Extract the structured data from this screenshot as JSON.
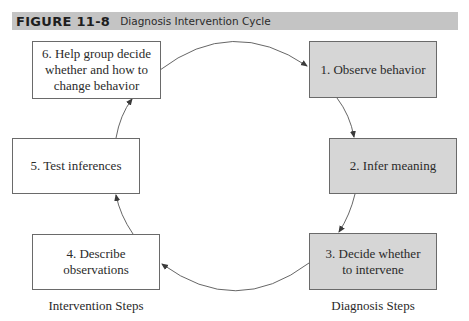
{
  "figure": {
    "number": "FIGURE 11-8",
    "title": "Diagnosis Intervention Cycle",
    "header_color": "#c4c4c4"
  },
  "steps": [
    {
      "id": 1,
      "label": "1. Observe behavior",
      "group": "diagnosis"
    },
    {
      "id": 2,
      "label": "2. Infer meaning",
      "group": "diagnosis"
    },
    {
      "id": 3,
      "label": "3. Decide whether\nto intervene",
      "group": "diagnosis"
    },
    {
      "id": 4,
      "label": "4. Describe\nobservations",
      "group": "intervention"
    },
    {
      "id": 5,
      "label": "5. Test inferences",
      "group": "intervention"
    },
    {
      "id": 6,
      "label": "6. Help group decide\nwhether and how to\nchange behavior",
      "group": "intervention"
    }
  ],
  "captions": {
    "intervention": "Intervention Steps",
    "diagnosis": "Diagnosis Steps"
  },
  "colors": {
    "diagnosis_fill": "#d6d6d6",
    "intervention_fill": "#ffffff",
    "border": "#6a6a6a",
    "arrow": "#555555"
  },
  "flow": [
    {
      "from": 1,
      "to": 2
    },
    {
      "from": 2,
      "to": 3
    },
    {
      "from": 3,
      "to": 4
    },
    {
      "from": 4,
      "to": 5
    },
    {
      "from": 5,
      "to": 6
    },
    {
      "from": 6,
      "to": 1
    }
  ]
}
